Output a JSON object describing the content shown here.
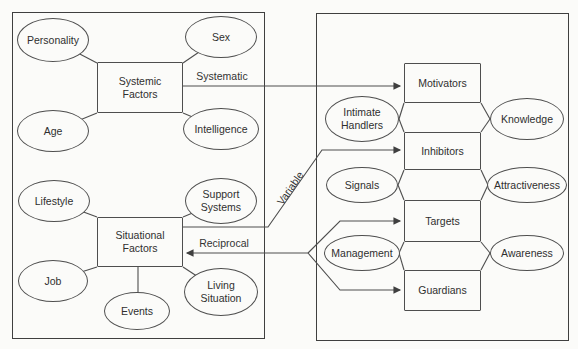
{
  "panels": {
    "left": {
      "systemic": {
        "box": "Systemic\nFactors",
        "personality": "Personality",
        "sex": "Sex",
        "age": "Age",
        "intelligence": "Intelligence"
      },
      "situational": {
        "box": "Situational\nFactors",
        "lifestyle": "Lifestyle",
        "support_systems": "Support\nSystems",
        "job": "Job",
        "events": "Events",
        "living_situation": "Living\nSituation"
      }
    },
    "right": {
      "boxes": {
        "motivators": "Motivators",
        "inhibitors": "Inhibitors",
        "targets": "Targets",
        "guardians": "Guardians"
      },
      "ellipses": {
        "intimate_handlers": "Intimate\nHandlers",
        "knowledge": "Knowledge",
        "signals": "Signals",
        "attractiveness": "Attractiveness",
        "management": "Management",
        "awareness": "Awareness"
      }
    }
  },
  "connectors": {
    "systematic": "Systematic",
    "variable": "Variable",
    "reciprocal": "Reciprocal"
  },
  "colors": {
    "line": "#4e4e4e",
    "border": "#3f3f3f",
    "background": "#fbfbf9",
    "text": "#2f2f2f"
  }
}
